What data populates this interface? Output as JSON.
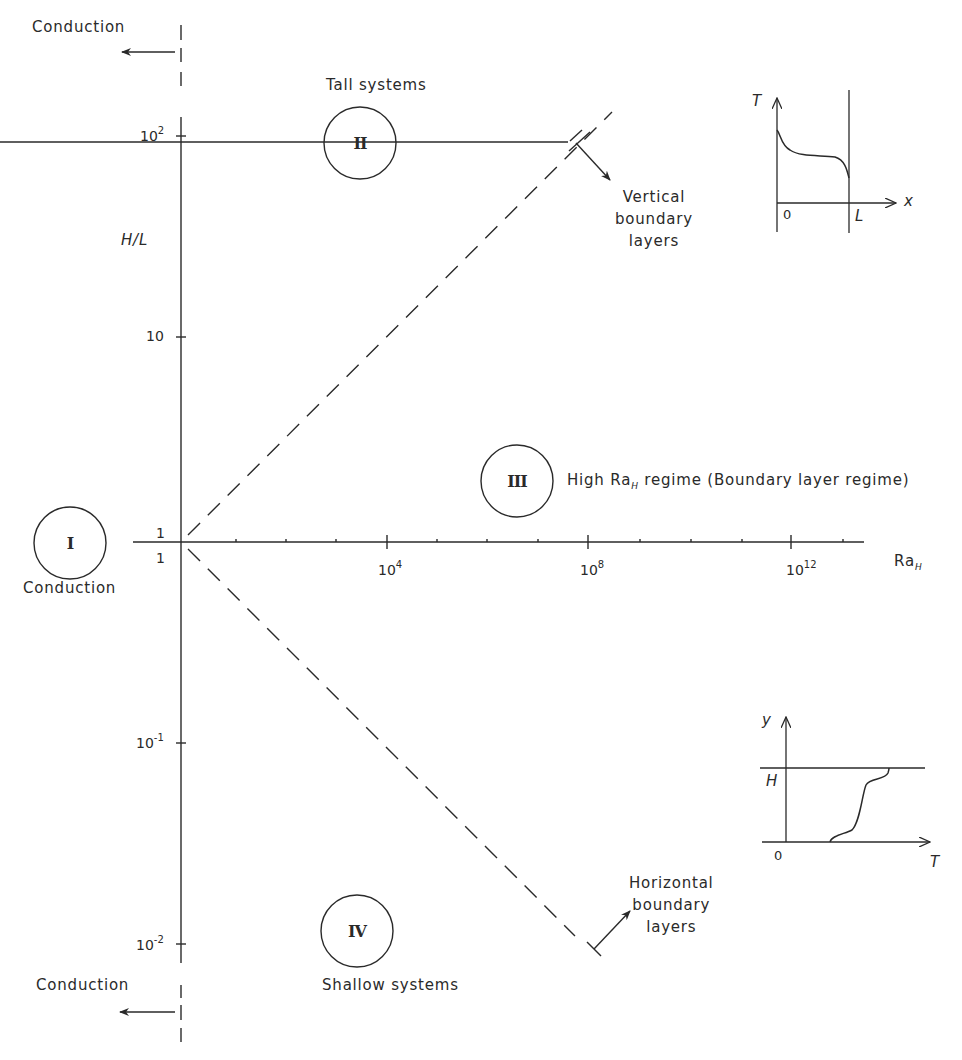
{
  "diagram": {
    "axes": {
      "x_label": "Ra",
      "x_label_sub": "H",
      "y_label": "H/L",
      "x_ticks": [
        {
          "base": "1",
          "exp": ""
        },
        {
          "base": "10",
          "exp": "4"
        },
        {
          "base": "10",
          "exp": "8"
        },
        {
          "base": "10",
          "exp": "12"
        }
      ],
      "y_ticks": [
        {
          "base": "10",
          "exp": "2"
        },
        {
          "base": "10",
          "exp": ""
        },
        {
          "base": "1",
          "exp": ""
        },
        {
          "base": "10",
          "exp": "-1"
        },
        {
          "base": "10",
          "exp": "-2"
        }
      ]
    },
    "regions": [
      {
        "id": "I",
        "numeral": "I",
        "label": "Conduction"
      },
      {
        "id": "II",
        "numeral": "II",
        "label": "Tall systems"
      },
      {
        "id": "III",
        "numeral": "III",
        "label_prefix": "High Ra",
        "label_sub": "H",
        "label_suffix": " regime (Boundary layer regime)"
      },
      {
        "id": "IV",
        "numeral": "IV",
        "label": "Shallow systems"
      }
    ],
    "annotations": {
      "conduction_top": "Conduction",
      "conduction_bottom": "Conduction",
      "vertical_bl": [
        "Vertical",
        "boundary",
        "layers"
      ],
      "horizontal_bl": [
        "Horizontal",
        "boundary",
        "layers"
      ]
    },
    "inset_vertical": {
      "y_axis": "T",
      "x_axis": "x",
      "origin": "0",
      "wall": "L"
    },
    "inset_horizontal": {
      "y_axis": "y",
      "x_axis": "T",
      "origin": "0",
      "top": "H"
    },
    "colors": {
      "ink": "#2a2a2a",
      "background": "#ffffff"
    }
  }
}
